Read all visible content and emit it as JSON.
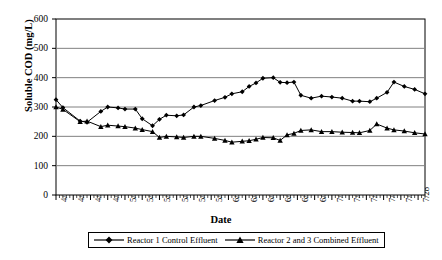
{
  "chart_data": {
    "type": "line",
    "title": "",
    "xlabel": "Date",
    "ylabel": "Soluble COD (mg/L)",
    "ylim": [
      0,
      600
    ],
    "ytick_labels": [
      "0",
      "100",
      "200",
      "300",
      "400",
      "500",
      "600"
    ],
    "ytick_values": [
      0,
      100,
      200,
      300,
      400,
      500,
      600
    ],
    "grid": true,
    "grid_axis": "y",
    "legend_position": "bottom",
    "x_axis_type": "date",
    "x_major_tick_labels": [
      "4/14",
      "4/19",
      "4/24",
      "4/29",
      "5/4",
      "5/9",
      "5/14",
      "5/19",
      "5/24",
      "5/29",
      "6/3",
      "6/8",
      "6/13",
      "6/18",
      "6/23",
      "6/28",
      "7/3",
      "7/8",
      "7/13",
      "7/18",
      "7/23",
      "7/28"
    ],
    "x_major_tick_days": [
      0,
      5,
      10,
      15,
      20,
      25,
      30,
      35,
      40,
      45,
      50,
      55,
      60,
      65,
      70,
      75,
      80,
      85,
      90,
      95,
      100,
      105
    ],
    "x_day_range": [
      0,
      107
    ],
    "minor_ticks_per_major": 5,
    "series": [
      {
        "name": "Reactor 1 Control Effluent",
        "marker": "diamond",
        "color": "#000000",
        "x": [
          0,
          2,
          7,
          9,
          13,
          15,
          18,
          20,
          23,
          25,
          28,
          30,
          32,
          35,
          37,
          40,
          42,
          46,
          49,
          51,
          54,
          56,
          58,
          60,
          63,
          65,
          67,
          69,
          71,
          74,
          77,
          80,
          83,
          86,
          88,
          91,
          93,
          96,
          98,
          101,
          104,
          107
        ],
        "y": [
          325,
          298,
          252,
          248,
          285,
          300,
          297,
          293,
          293,
          260,
          236,
          258,
          272,
          270,
          273,
          300,
          305,
          322,
          333,
          345,
          352,
          370,
          382,
          398,
          400,
          384,
          383,
          385,
          340,
          330,
          337,
          334,
          330,
          320,
          320,
          318,
          330,
          350,
          385,
          370,
          360,
          345
        ]
      },
      {
        "name": "Reactor 2 and 3 Combined Effluent",
        "marker": "triangle",
        "color": "#000000",
        "x": [
          0,
          2,
          7,
          9,
          13,
          15,
          18,
          20,
          23,
          25,
          28,
          30,
          32,
          35,
          37,
          40,
          42,
          46,
          49,
          51,
          54,
          56,
          58,
          60,
          63,
          65,
          67,
          69,
          71,
          74,
          77,
          80,
          83,
          86,
          88,
          91,
          93,
          96,
          98,
          101,
          104,
          107
        ],
        "y": [
          300,
          292,
          250,
          252,
          233,
          238,
          235,
          233,
          228,
          223,
          216,
          196,
          200,
          198,
          196,
          200,
          200,
          193,
          186,
          180,
          183,
          185,
          190,
          196,
          195,
          186,
          205,
          210,
          220,
          222,
          216,
          216,
          214,
          213,
          212,
          220,
          242,
          228,
          222,
          218,
          212,
          208
        ]
      }
    ]
  },
  "axis": {
    "y_title": "Soluble COD (mg/L)",
    "x_title": "Date"
  },
  "legend": {
    "entries": [
      {
        "label": "Reactor 1 Control Effluent",
        "marker": "diamond-marker-icon"
      },
      {
        "label": "Reactor 2 and 3 Combined Effluent",
        "marker": "triangle-marker-icon"
      }
    ]
  }
}
